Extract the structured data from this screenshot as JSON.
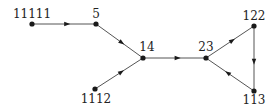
{
  "diagram": {
    "type": "directed-graph",
    "nodes": [
      {
        "id": "n11111",
        "label": "11111",
        "x": 32,
        "y": 24,
        "label_x": 32,
        "label_y": 18,
        "label_anchor": "middle"
      },
      {
        "id": "n5",
        "label": "5",
        "x": 96,
        "y": 24,
        "label_x": 96,
        "label_y": 18,
        "label_anchor": "middle"
      },
      {
        "id": "n14",
        "label": "14",
        "x": 143,
        "y": 58,
        "label_x": 147,
        "label_y": 51,
        "label_anchor": "middle"
      },
      {
        "id": "n1112",
        "label": "1112",
        "x": 95,
        "y": 89,
        "label_x": 96,
        "label_y": 103,
        "label_anchor": "middle"
      },
      {
        "id": "n23",
        "label": "23",
        "x": 206,
        "y": 58,
        "label_x": 206,
        "label_y": 51,
        "label_anchor": "middle"
      },
      {
        "id": "n122",
        "label": "122",
        "x": 254,
        "y": 26,
        "label_x": 254,
        "label_y": 20,
        "label_anchor": "middle"
      },
      {
        "id": "n113",
        "label": "113",
        "x": 254,
        "y": 91,
        "label_x": 254,
        "label_y": 104,
        "label_anchor": "middle"
      }
    ],
    "edges": [
      {
        "from": "n11111",
        "to": "n5"
      },
      {
        "from": "n5",
        "to": "n14"
      },
      {
        "from": "n1112",
        "to": "n14"
      },
      {
        "from": "n14",
        "to": "n23"
      },
      {
        "from": "n23",
        "to": "n122"
      },
      {
        "from": "n122",
        "to": "n113"
      },
      {
        "from": "n113",
        "to": "n23"
      }
    ],
    "colors": {
      "edge": "#555555",
      "node": "#1a1a1a",
      "label": "#222222",
      "background": "#ffffff"
    }
  }
}
